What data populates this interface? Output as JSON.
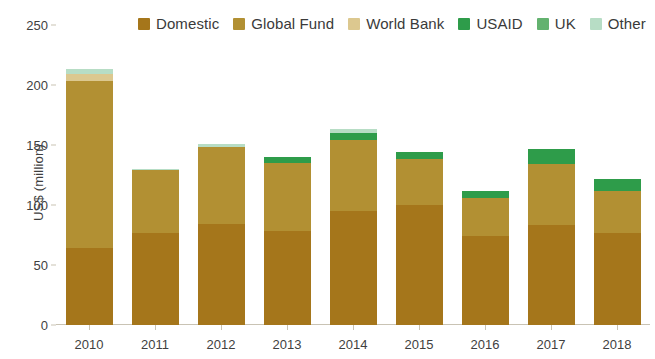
{
  "chart_data": {
    "type": "bar",
    "stacked": true,
    "title": "",
    "xlabel": "",
    "ylabel": "US$ (million)",
    "categories": [
      "2010",
      "2011",
      "2012",
      "2013",
      "2014",
      "2015",
      "2016",
      "2017",
      "2018"
    ],
    "ylim": [
      0,
      250
    ],
    "yticks": [
      0,
      50,
      100,
      150,
      200,
      250
    ],
    "grid": false,
    "legend_position": "top",
    "series": [
      {
        "name": "Domestic",
        "color": "#a5761b",
        "values": [
          64,
          77,
          84,
          78,
          95,
          100,
          74,
          83,
          77
        ]
      },
      {
        "name": "Global Fund",
        "color": "#b29033",
        "values": [
          139,
          52,
          64,
          57,
          59,
          38,
          32,
          51,
          35
        ]
      },
      {
        "name": "World Bank",
        "color": "#dcc88f",
        "values": [
          6,
          0,
          0,
          0,
          0,
          0,
          0,
          0,
          0
        ]
      },
      {
        "name": "USAID",
        "color": "#2e9c4a",
        "values": [
          0,
          0,
          0,
          5,
          6,
          6,
          6,
          13,
          10
        ]
      },
      {
        "name": "UK",
        "color": "#63b26f",
        "values": [
          0,
          0,
          0,
          0,
          0,
          0,
          0,
          0,
          0
        ]
      },
      {
        "name": "Other",
        "color": "#b7ddc5",
        "values": [
          4,
          1,
          3,
          0,
          3,
          0,
          0,
          0,
          0
        ]
      }
    ],
    "totals": [
      213,
      130,
      151,
      140,
      163,
      144,
      112,
      147,
      122
    ]
  },
  "legend": {
    "items": [
      {
        "label": "Domestic",
        "color": "#a5761b"
      },
      {
        "label": "Global Fund",
        "color": "#b29033"
      },
      {
        "label": "World Bank",
        "color": "#dcc88f"
      },
      {
        "label": "USAID",
        "color": "#2e9c4a"
      },
      {
        "label": "UK",
        "color": "#63b26f"
      },
      {
        "label": "Other",
        "color": "#b7ddc5"
      }
    ]
  },
  "axes": {
    "y_title": "US$ (million)",
    "y_ticks": [
      "250",
      "200",
      "150",
      "100",
      "50",
      "0"
    ],
    "x_ticks": [
      "2010",
      "2011",
      "2012",
      "2013",
      "2014",
      "2015",
      "2016",
      "2017",
      "2018"
    ]
  },
  "colors": {
    "domestic": "#a5761b",
    "global_fund": "#b29033",
    "world_bank": "#dcc88f",
    "usaid": "#2e9c4a",
    "uk": "#63b26f",
    "other": "#b7ddc5",
    "axis": "#c9c3b4",
    "text": "#3f3f3f",
    "background": "#ffffff"
  }
}
